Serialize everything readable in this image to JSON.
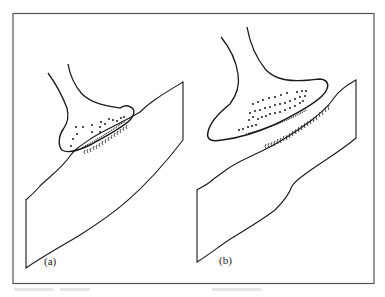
{
  "figure": {
    "colors": {
      "line": "#1a1a1a",
      "frame": "#555555",
      "background": "#ffffff"
    },
    "panels": [
      {
        "id": "a",
        "label": "(a)",
        "vesicle_count_approx": 16,
        "receptor_count_approx": 12,
        "bouton_size": "small"
      },
      {
        "id": "b",
        "label": "(b)",
        "vesicle_count_approx": 40,
        "receptor_count_approx": 22,
        "bouton_size": "large"
      }
    ]
  }
}
